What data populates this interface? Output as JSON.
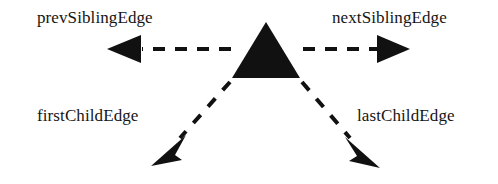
{
  "figure": {
    "type": "node-link-diagram",
    "background_color": "#ffffff",
    "ink_color": "#111111",
    "node": {
      "shape": "triangle",
      "name": "node",
      "fill_color": "#111111",
      "apex": {
        "x": 266,
        "y": 22
      },
      "bottom_left": {
        "x": 232,
        "y": 78
      },
      "bottom_right": {
        "x": 300,
        "y": 78
      }
    },
    "edges": [
      {
        "id": "prevSiblingEdge",
        "label": "prevSiblingEdge",
        "direction": "left",
        "line_style": "dashed",
        "arrowhead": "filled-triangle",
        "from": {
          "x": 231,
          "y": 49
        },
        "to": {
          "x": 107,
          "y": 49
        },
        "label_position": {
          "x": 37,
          "y": 8
        }
      },
      {
        "id": "nextSiblingEdge",
        "label": "nextSiblingEdge",
        "direction": "right",
        "line_style": "dashed",
        "arrowhead": "filled-triangle",
        "from": {
          "x": 301,
          "y": 49
        },
        "to": {
          "x": 410,
          "y": 49
        },
        "label_position": {
          "x": 332,
          "y": 8
        }
      },
      {
        "id": "firstChildEdge",
        "label": "firstChildEdge",
        "direction": "down-left",
        "line_style": "dashed",
        "arrowhead": "filled-triangle",
        "from": {
          "x": 231,
          "y": 80
        },
        "to": {
          "x": 152,
          "y": 165
        },
        "label_position": {
          "x": 37,
          "y": 106
        }
      },
      {
        "id": "lastChildEdge",
        "label": "lastChildEdge",
        "direction": "down-right",
        "line_style": "dashed",
        "arrowhead": "filled-triangle",
        "from": {
          "x": 301,
          "y": 80
        },
        "to": {
          "x": 380,
          "y": 168
        },
        "label_position": {
          "x": 357,
          "y": 106
        }
      }
    ]
  }
}
